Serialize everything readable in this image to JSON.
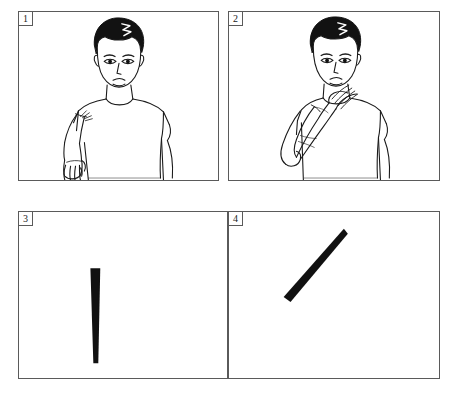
{
  "figure": {
    "panel_count": 4,
    "background_color": "#ffffff",
    "border_color": "#5a5a5a",
    "ink_color": "#000000",
    "panels": [
      {
        "number": "1",
        "type": "illustration",
        "subject": "man-standing-arm-extended-down",
        "description": "Line drawing of a young man in a short-sleeved t-shirt, front view, his left arm extended downward and forward with open hand, fingers visible."
      },
      {
        "number": "2",
        "type": "illustration",
        "subject": "man-standing-saluting",
        "description": "Line drawing of the same young man, his left hand raised to the side of his forehead in a salute, elbow bent and pointing outward."
      },
      {
        "number": "3",
        "type": "abstract-bar",
        "subject": "vertical-tapered-bar",
        "description": "Solid black tapered bar oriented nearly vertically, wide at the top and narrowing toward the bottom.",
        "orientation_degrees": 2,
        "fill_color": "#111111"
      },
      {
        "number": "4",
        "type": "abstract-bar",
        "subject": "diagonal-tapered-bar",
        "description": "Solid black tapered bar oriented diagonally from lower left to upper right, wide at the lower-left end and narrowing toward the upper-right tip.",
        "orientation_degrees": 48,
        "fill_color": "#111111"
      }
    ]
  }
}
